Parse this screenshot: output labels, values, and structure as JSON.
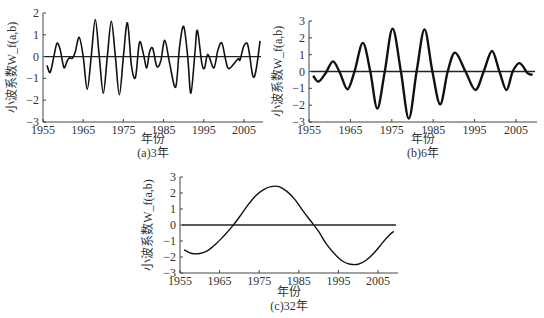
{
  "chart_data": [
    {
      "type": "line",
      "title": "(a)3年",
      "xlabel": "年份",
      "ylabel": "小波系数W_f(a,b)",
      "xticks": [
        "1955",
        "1965",
        "1975",
        "1985",
        "1995",
        "2005"
      ],
      "yticks": [
        "2",
        "1",
        "0",
        "-1",
        "-2",
        "-3"
      ],
      "xlim": [
        1955,
        2009
      ],
      "ylim": [
        -3,
        2
      ],
      "zero_line": true,
      "series": [
        {
          "name": "3年",
          "points": [
            [
              1956,
              -0.4
            ],
            [
              1956.8,
              -0.72
            ],
            [
              1957.8,
              0.1
            ],
            [
              1958.5,
              0.62
            ],
            [
              1959.3,
              0.3
            ],
            [
              1960.2,
              -0.5
            ],
            [
              1961,
              -0.2
            ],
            [
              1961.6,
              -0.05
            ],
            [
              1962.3,
              -0.08
            ],
            [
              1963,
              0.2
            ],
            [
              1964,
              0.88
            ],
            [
              1965,
              0
            ],
            [
              1966,
              -1.5
            ],
            [
              1967,
              0
            ],
            [
              1968,
              1.7
            ],
            [
              1969,
              0
            ],
            [
              1970,
              -1.68
            ],
            [
              1971,
              0
            ],
            [
              1972,
              1.62
            ],
            [
              1973,
              0
            ],
            [
              1974,
              -1.75
            ],
            [
              1975,
              0
            ],
            [
              1976,
              1.55
            ],
            [
              1977,
              -0.4
            ],
            [
              1978,
              -0.95
            ],
            [
              1979,
              0.65
            ],
            [
              1980,
              0.1
            ],
            [
              1980.8,
              -0.52
            ],
            [
              1981.5,
              0.2
            ],
            [
              1982.3,
              0.38
            ],
            [
              1983.3,
              -0.45
            ],
            [
              1984.3,
              -0.2
            ],
            [
              1985.3,
              0.75
            ],
            [
              1986.5,
              -0.3
            ],
            [
              1988,
              -1.4
            ],
            [
              1989,
              0.5
            ],
            [
              1990,
              1.38
            ],
            [
              1991,
              0
            ],
            [
              1991.8,
              -1.68
            ],
            [
              1992.8,
              0.2
            ],
            [
              1993.4,
              1.2
            ],
            [
              1994.5,
              -0.3
            ],
            [
              1995.2,
              -0.52
            ],
            [
              1996,
              0.1
            ],
            [
              1997.5,
              -0.52
            ],
            [
              1998.5,
              0.3
            ],
            [
              1999.5,
              0.62
            ],
            [
              2000.5,
              -0.2
            ],
            [
              2001.3,
              -0.55
            ],
            [
              2003.5,
              -0.1
            ],
            [
              2004,
              -0.15
            ],
            [
              2005,
              0.5
            ],
            [
              2006,
              0.5
            ],
            [
              2007.2,
              -0.88
            ],
            [
              2008,
              -0.6
            ],
            [
              2009,
              0.72
            ]
          ]
        }
      ]
    },
    {
      "type": "line",
      "title": "(b)6年",
      "xlabel": "年份",
      "ylabel": "小波系数W_f(a,b)",
      "xticks": [
        "1955",
        "1965",
        "1975",
        "1985",
        "1995",
        "2005"
      ],
      "yticks": [
        "3",
        "2",
        "1",
        "0",
        "-1",
        "-2",
        "-3"
      ],
      "xlim": [
        1955,
        2009
      ],
      "ylim": [
        -3,
        3
      ],
      "zero_line": true,
      "series": [
        {
          "name": "6年",
          "points": [
            [
              1956,
              -0.25
            ],
            [
              1957.3,
              -0.6
            ],
            [
              1959,
              -0.1
            ],
            [
              1960.8,
              0.6
            ],
            [
              1962.5,
              -0.1
            ],
            [
              1964.3,
              -1.05
            ],
            [
              1966,
              0
            ],
            [
              1968,
              1.7
            ],
            [
              1969.8,
              0
            ],
            [
              1971.5,
              -2.2
            ],
            [
              1973.3,
              0
            ],
            [
              1975.2,
              2.55
            ],
            [
              1977.2,
              0
            ],
            [
              1979.1,
              -2.8
            ],
            [
              1981,
              0
            ],
            [
              1982.9,
              2.5
            ],
            [
              1984.8,
              0
            ],
            [
              1986.7,
              -1.95
            ],
            [
              1988.5,
              0
            ],
            [
              1990.3,
              1.12
            ],
            [
              1992.8,
              0
            ],
            [
              1995.2,
              -1.1
            ],
            [
              1997.2,
              0
            ],
            [
              1999.2,
              1.22
            ],
            [
              2001,
              0
            ],
            [
              2002.7,
              -1.1
            ],
            [
              2004.2,
              0
            ],
            [
              2005.9,
              0.5
            ],
            [
              2007.8,
              -0.1
            ],
            [
              2009,
              -0.2
            ]
          ]
        }
      ]
    },
    {
      "type": "line",
      "title": "(c)32年",
      "xlabel": "年份",
      "ylabel": "小波系数W_f(a,b)",
      "xticks": [
        "1955",
        "1965",
        "1975",
        "1985",
        "1995",
        "2005"
      ],
      "yticks": [
        "3",
        "2",
        "1",
        "0",
        "-1",
        "-2",
        "-3"
      ],
      "xlim": [
        1955,
        2009
      ],
      "ylim": [
        -3,
        3
      ],
      "zero_line": true,
      "series": [
        {
          "name": "32年",
          "points": [
            [
              1956,
              -1.55
            ],
            [
              1958,
              -1.78
            ],
            [
              1960,
              -1.78
            ],
            [
              1962,
              -1.6
            ],
            [
              1964,
              -1.2
            ],
            [
              1966,
              -0.7
            ],
            [
              1968,
              -0.15
            ],
            [
              1970,
              0.5
            ],
            [
              1972,
              1.2
            ],
            [
              1974,
              1.8
            ],
            [
              1976,
              2.2
            ],
            [
              1978,
              2.4
            ],
            [
              1980,
              2.4
            ],
            [
              1982,
              2.1
            ],
            [
              1984,
              1.6
            ],
            [
              1986,
              0.9
            ],
            [
              1988,
              0.25
            ],
            [
              1990,
              -0.4
            ],
            [
              1992,
              -1.2
            ],
            [
              1994,
              -1.8
            ],
            [
              1996,
              -2.25
            ],
            [
              1998,
              -2.45
            ],
            [
              2000,
              -2.45
            ],
            [
              2002,
              -2.2
            ],
            [
              2004,
              -1.75
            ],
            [
              2006,
              -1.15
            ],
            [
              2008,
              -0.6
            ],
            [
              2009,
              -0.4
            ]
          ]
        }
      ]
    }
  ],
  "panels": [
    {
      "caption": "(a)3年",
      "xlabel": "年份",
      "ylabel": "小波系数W_f(a,b)"
    },
    {
      "caption": "(b)6年",
      "xlabel": "年份",
      "ylabel": "小波系数W_f(a,b)"
    },
    {
      "caption": "(c)32年",
      "xlabel": "年份",
      "ylabel": "小波系数W_f(a,b)"
    }
  ]
}
